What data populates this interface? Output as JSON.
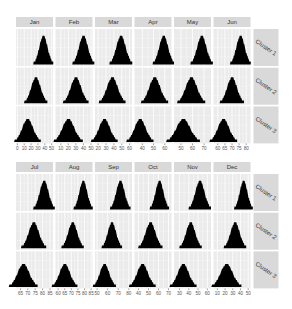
{
  "chart_data": {
    "type": "area",
    "subtype": "faceted density (histogram-style filled shapes)",
    "title": "",
    "xlabel": "",
    "ylabel": "",
    "grid": true,
    "facet_rows": [
      "Cluster 1",
      "Cluster 2",
      "Cluster 3"
    ],
    "blocks": [
      {
        "months": [
          "Jan",
          "Feb",
          "Mar",
          "Apr",
          "May",
          "Jun"
        ],
        "panels": [
          {
            "month": "Jan",
            "ticks": [
              0,
              10,
              20,
              30,
              40,
              50
            ],
            "xlim": [
              -2,
              52
            ],
            "peaks": {
              "Cluster 1": 38,
              "Cluster 2": 27,
              "Cluster 3": 15
            },
            "spread": {
              "Cluster 1": 6,
              "Cluster 2": 7,
              "Cluster 3": 8
            }
          },
          {
            "month": "Feb",
            "ticks": [
              10,
              20,
              30,
              40,
              50
            ],
            "xlim": [
              3,
              52
            ],
            "peaks": {
              "Cluster 1": 40,
              "Cluster 2": 30,
              "Cluster 3": 20
            },
            "spread": {
              "Cluster 1": 6,
              "Cluster 2": 7,
              "Cluster 3": 8
            }
          },
          {
            "month": "Mar",
            "ticks": [
              20,
              30,
              40,
              50,
              60
            ],
            "xlim": [
              16,
              63
            ],
            "peaks": {
              "Cluster 1": 49,
              "Cluster 2": 38,
              "Cluster 3": 28
            },
            "spread": {
              "Cluster 1": 6,
              "Cluster 2": 7,
              "Cluster 3": 7
            }
          },
          {
            "month": "Apr",
            "ticks": [
              40,
              50,
              60
            ],
            "xlim": [
              33,
              66
            ],
            "peaks": {
              "Cluster 1": 59,
              "Cluster 2": 51,
              "Cluster 3": 38
            },
            "spread": {
              "Cluster 1": 4,
              "Cluster 2": 5,
              "Cluster 3": 5
            }
          },
          {
            "month": "May",
            "ticks": [
              50,
              60,
              70
            ],
            "xlim": [
              44,
              76
            ],
            "peaks": {
              "Cluster 1": 68,
              "Cluster 2": 59,
              "Cluster 3": 52
            },
            "spread": {
              "Cluster 1": 4,
              "Cluster 2": 5,
              "Cluster 3": 6
            }
          },
          {
            "month": "Jun",
            "ticks": [
              60,
              65,
              70,
              75,
              80
            ],
            "xlim": [
              57,
              83
            ],
            "peaks": {
              "Cluster 1": 76,
              "Cluster 2": 70,
              "Cluster 3": 64
            },
            "spread": {
              "Cluster 1": 3,
              "Cluster 2": 3.5,
              "Cluster 3": 4
            }
          }
        ]
      },
      {
        "months": [
          "Jul",
          "Aug",
          "Sep",
          "Oct",
          "Nov",
          "Dec"
        ],
        "panels": [
          {
            "month": "Jul",
            "ticks": [
              65,
              70,
              75,
              80,
              85
            ],
            "xlim": [
              62,
              87
            ],
            "peaks": {
              "Cluster 1": 81,
              "Cluster 2": 74,
              "Cluster 3": 67
            },
            "spread": {
              "Cluster 1": 3,
              "Cluster 2": 3.5,
              "Cluster 3": 4
            }
          },
          {
            "month": "Aug",
            "ticks": [
              60,
              65,
              70,
              75,
              80,
              85
            ],
            "xlim": [
              58,
              86
            ],
            "peaks": {
              "Cluster 1": 79,
              "Cluster 2": 71,
              "Cluster 3": 65
            },
            "spread": {
              "Cluster 1": 3,
              "Cluster 2": 3.5,
              "Cluster 3": 4
            }
          },
          {
            "month": "Sep",
            "ticks": [
              50,
              60,
              70,
              80
            ],
            "xlim": [
              48,
              83
            ],
            "peaks": {
              "Cluster 1": 72,
              "Cluster 2": 64,
              "Cluster 3": 57
            },
            "spread": {
              "Cluster 1": 4,
              "Cluster 2": 4,
              "Cluster 3": 4.5
            }
          },
          {
            "month": "Oct",
            "ticks": [
              40,
              50,
              60,
              70
            ],
            "xlim": [
              36,
              73
            ],
            "peaks": {
              "Cluster 1": 61,
              "Cluster 2": 52,
              "Cluster 3": 44
            },
            "spread": {
              "Cluster 1": 4,
              "Cluster 2": 5,
              "Cluster 3": 5.5
            }
          },
          {
            "month": "Nov",
            "ticks": [
              30,
              40,
              50,
              60
            ],
            "xlim": [
              24,
              64
            ],
            "peaks": {
              "Cluster 1": 52,
              "Cluster 2": 42,
              "Cluster 3": 34
            },
            "spread": {
              "Cluster 1": 5,
              "Cluster 2": 5,
              "Cluster 3": 6
            }
          },
          {
            "month": "Dec",
            "ticks": [
              10,
              20,
              30,
              40,
              50
            ],
            "xlim": [
              5,
              53
            ],
            "peaks": {
              "Cluster 1": 44,
              "Cluster 2": 33,
              "Cluster 3": 22
            },
            "spread": {
              "Cluster 1": 5,
              "Cluster 2": 6,
              "Cluster 3": 8
            }
          }
        ]
      }
    ],
    "colors": {
      "panel_bg": "#ebebeb",
      "grid": "#ffffff",
      "strip_bg": "#d9d9d9",
      "fill": "#000000",
      "text": "#333333",
      "tick_text": "#555555"
    }
  }
}
